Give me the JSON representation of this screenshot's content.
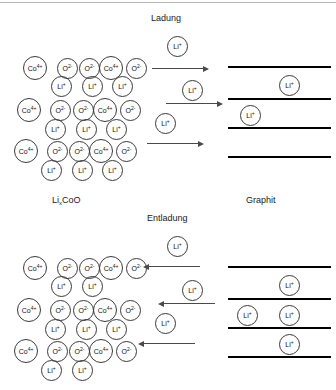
{
  "diagram": {
    "title_top_process": "Ladung",
    "title_bottom_process": "Entladung",
    "label_cathode_prefix": "Li",
    "label_cathode_subscript": "x",
    "label_cathode_suffix": "CoO",
    "label_anode": "Graphit",
    "ion_cobalt": "Co",
    "ion_cobalt_charge": "4+",
    "ion_oxygen": "O",
    "ion_oxygen_charge": "2-",
    "ion_lithium": "Li",
    "ion_lithium_charge": "+",
    "colors": {
      "ion_stroke": "#3a3a3a",
      "sheet": "#000000",
      "arrow": "#4a4a4a",
      "text": "#1a1a1a",
      "background": "#ffffff"
    }
  },
  "chart_data": {
    "type": "diagram",
    "panels": [
      {
        "name": "ladung",
        "process_label": "Ladung",
        "direction": "right",
        "cathode_li_count": 9,
        "anode_li_count": 2,
        "arrow_count": 3,
        "free_li_count": 3
      },
      {
        "name": "entladung",
        "process_label": "Entladung",
        "direction": "left",
        "cathode_li_count": 7,
        "anode_li_count": 4,
        "arrow_count": 3,
        "free_li_count": 3
      }
    ],
    "legend": [
      "Co4+",
      "O2-",
      "Li+"
    ]
  },
  "top_panel": {
    "process": "Ladung",
    "lattice_ions": [
      {
        "type": "co",
        "x": 23,
        "y": 56,
        "d": 24
      },
      {
        "type": "o",
        "x": 57,
        "y": 58,
        "d": 21
      },
      {
        "type": "o",
        "x": 79,
        "y": 58,
        "d": 21
      },
      {
        "type": "co",
        "x": 99,
        "y": 56,
        "d": 24
      },
      {
        "type": "o",
        "x": 126,
        "y": 58,
        "d": 21
      },
      {
        "type": "li",
        "x": 51,
        "y": 76,
        "d": 21
      },
      {
        "type": "li",
        "x": 82,
        "y": 76,
        "d": 21
      },
      {
        "type": "li",
        "x": 112,
        "y": 76,
        "d": 21
      },
      {
        "type": "co",
        "x": 17,
        "y": 98,
        "d": 24
      },
      {
        "type": "o",
        "x": 50,
        "y": 100,
        "d": 21
      },
      {
        "type": "o",
        "x": 73,
        "y": 100,
        "d": 21
      },
      {
        "type": "co",
        "x": 93,
        "y": 98,
        "d": 24
      },
      {
        "type": "o",
        "x": 120,
        "y": 100,
        "d": 21
      },
      {
        "type": "li",
        "x": 45,
        "y": 119,
        "d": 21
      },
      {
        "type": "li",
        "x": 76,
        "y": 119,
        "d": 21
      },
      {
        "type": "li",
        "x": 106,
        "y": 119,
        "d": 21
      },
      {
        "type": "co",
        "x": 14,
        "y": 139,
        "d": 24
      },
      {
        "type": "o",
        "x": 47,
        "y": 141,
        "d": 21
      },
      {
        "type": "o",
        "x": 69,
        "y": 141,
        "d": 21
      },
      {
        "type": "co",
        "x": 89,
        "y": 139,
        "d": 24
      },
      {
        "type": "o",
        "x": 116,
        "y": 141,
        "d": 21
      },
      {
        "type": "li",
        "x": 41,
        "y": 160,
        "d": 21
      },
      {
        "type": "li",
        "x": 72,
        "y": 160,
        "d": 21
      },
      {
        "type": "li",
        "x": 102,
        "y": 160,
        "d": 21
      }
    ],
    "free_ions": [
      {
        "type": "li",
        "x": 167,
        "y": 36,
        "d": 21
      },
      {
        "type": "li",
        "x": 182,
        "y": 80,
        "d": 21
      },
      {
        "type": "li",
        "x": 155,
        "y": 113,
        "d": 21
      }
    ],
    "arrows": [
      {
        "x": 152,
        "y": 68,
        "w": 52,
        "dir": "right"
      },
      {
        "x": 166,
        "y": 103,
        "w": 52,
        "dir": "right"
      },
      {
        "x": 147,
        "y": 143,
        "w": 52,
        "dir": "right"
      }
    ],
    "sheets": [
      {
        "x": 228,
        "y": 66,
        "w": 103
      },
      {
        "x": 228,
        "y": 98,
        "w": 103
      },
      {
        "x": 228,
        "y": 127,
        "w": 103
      },
      {
        "x": 228,
        "y": 156,
        "w": 103
      }
    ],
    "anode_ions": [
      {
        "type": "li",
        "x": 279,
        "y": 75,
        "d": 21
      },
      {
        "type": "li",
        "x": 240,
        "y": 105,
        "d": 21
      }
    ]
  },
  "bottom_panel": {
    "process": "Entladung",
    "lattice_ions": [
      {
        "type": "co",
        "x": 23,
        "y": 256,
        "d": 24
      },
      {
        "type": "o",
        "x": 57,
        "y": 258,
        "d": 21
      },
      {
        "type": "o",
        "x": 79,
        "y": 258,
        "d": 21
      },
      {
        "type": "co",
        "x": 99,
        "y": 256,
        "d": 24
      },
      {
        "type": "o",
        "x": 126,
        "y": 258,
        "d": 21
      },
      {
        "type": "li",
        "x": 51,
        "y": 276,
        "d": 21
      },
      {
        "type": "li",
        "x": 82,
        "y": 276,
        "d": 21
      },
      {
        "type": "co",
        "x": 17,
        "y": 298,
        "d": 24
      },
      {
        "type": "o",
        "x": 50,
        "y": 300,
        "d": 21
      },
      {
        "type": "o",
        "x": 73,
        "y": 300,
        "d": 21
      },
      {
        "type": "co",
        "x": 93,
        "y": 298,
        "d": 24
      },
      {
        "type": "o",
        "x": 120,
        "y": 300,
        "d": 21
      },
      {
        "type": "li",
        "x": 45,
        "y": 319,
        "d": 21
      },
      {
        "type": "li",
        "x": 76,
        "y": 319,
        "d": 21
      },
      {
        "type": "li",
        "x": 106,
        "y": 319,
        "d": 21
      },
      {
        "type": "co",
        "x": 14,
        "y": 339,
        "d": 24
      },
      {
        "type": "o",
        "x": 47,
        "y": 341,
        "d": 21
      },
      {
        "type": "o",
        "x": 69,
        "y": 341,
        "d": 21
      },
      {
        "type": "co",
        "x": 89,
        "y": 339,
        "d": 24
      },
      {
        "type": "o",
        "x": 116,
        "y": 341,
        "d": 21
      },
      {
        "type": "li",
        "x": 41,
        "y": 360,
        "d": 21
      },
      {
        "type": "li",
        "x": 72,
        "y": 360,
        "d": 21
      }
    ],
    "free_ions": [
      {
        "type": "li",
        "x": 167,
        "y": 236,
        "d": 21
      },
      {
        "type": "li",
        "x": 182,
        "y": 280,
        "d": 21
      },
      {
        "type": "li",
        "x": 155,
        "y": 313,
        "d": 21
      }
    ],
    "arrows": [
      {
        "x": 148,
        "y": 266,
        "w": 52,
        "dir": "left"
      },
      {
        "x": 163,
        "y": 303,
        "w": 52,
        "dir": "left"
      },
      {
        "x": 143,
        "y": 343,
        "w": 52,
        "dir": "left"
      }
    ],
    "sheets": [
      {
        "x": 228,
        "y": 266,
        "w": 103
      },
      {
        "x": 228,
        "y": 298,
        "w": 103
      },
      {
        "x": 228,
        "y": 327,
        "w": 103
      },
      {
        "x": 228,
        "y": 356,
        "w": 103
      }
    ],
    "anode_ions": [
      {
        "type": "li",
        "x": 279,
        "y": 275,
        "d": 21
      },
      {
        "type": "li",
        "x": 237,
        "y": 305,
        "d": 21
      },
      {
        "type": "li",
        "x": 279,
        "y": 305,
        "d": 21
      },
      {
        "type": "li",
        "x": 279,
        "y": 334,
        "d": 21
      }
    ]
  },
  "headings": {
    "ladung": {
      "text": "Ladung",
      "x": 151,
      "y": 14
    },
    "entladung": {
      "text": "Entladung",
      "x": 147,
      "y": 214
    },
    "cathode": {
      "x": 52,
      "y": 196
    },
    "anode": {
      "text": "Graphit",
      "x": 246,
      "y": 196
    }
  }
}
